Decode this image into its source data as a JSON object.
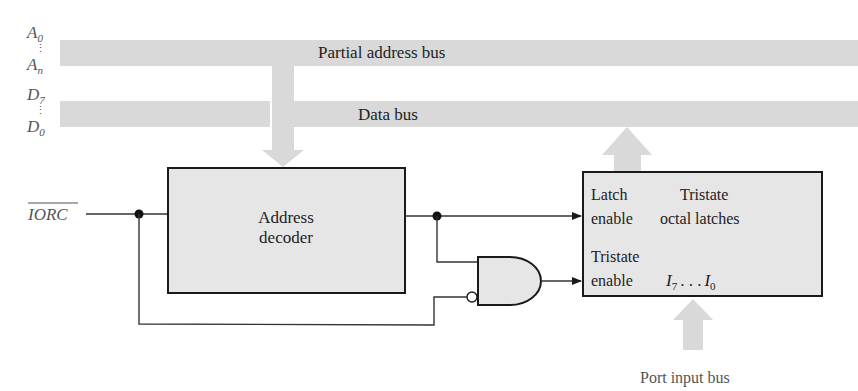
{
  "diagram": {
    "title": "",
    "colors": {
      "bus_fill": "#d9d9d9",
      "box_fill": "#e6e6e6",
      "stroke": "#1a1a1a",
      "wire": "#333333",
      "caption_text": "#555555"
    },
    "left_labels": {
      "address_top": {
        "base": "A",
        "sub": "0"
      },
      "address_bottom": {
        "base": "A",
        "sub": "n"
      },
      "data_top": {
        "base": "D",
        "sub": "7"
      },
      "data_bottom": {
        "base": "D",
        "sub": "0"
      },
      "vertical_dots": "⋮"
    },
    "buses": {
      "address": {
        "label": "Partial address bus"
      },
      "data": {
        "label": "Data bus"
      },
      "port_input": {
        "label": "Port input bus"
      }
    },
    "signals": {
      "iorc": {
        "label": "IORC",
        "active_low": true
      }
    },
    "blocks": {
      "address_decoder": {
        "line1": "Address",
        "line2": "decoder"
      },
      "latch": {
        "latch_enable_line1": "Latch",
        "latch_enable_line2": "enable",
        "title_line1": "Tristate",
        "title_line2": "octal latches",
        "tristate_enable_line1": "Tristate",
        "tristate_enable_line2": "enable",
        "inputs": {
          "first": {
            "base": "I",
            "sub": "7"
          },
          "ellipsis": ". . .",
          "last": {
            "base": "I",
            "sub": "0"
          }
        }
      }
    },
    "gates": {
      "and_gate": {
        "type": "AND",
        "inverted_input": "lower"
      }
    }
  }
}
